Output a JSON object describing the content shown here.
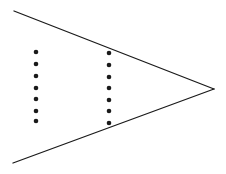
{
  "diagram": {
    "width": 226,
    "height": 174,
    "background": "#ffffff",
    "stroke_color": "#1a1a1a",
    "lines": [
      {
        "name": "upper-converging-line",
        "x1": 14,
        "y1": 11,
        "x2": 214,
        "y2": 89
      },
      {
        "name": "lower-converging-line",
        "x1": 13,
        "y1": 163,
        "x2": 214,
        "y2": 89
      }
    ],
    "apex": {
      "x": 214,
      "y": 89
    },
    "dot_columns": [
      {
        "name": "left-dot-column",
        "x": 36,
        "ys": [
          52,
          64,
          76,
          88,
          99,
          111,
          121
        ]
      },
      {
        "name": "right-dot-column",
        "x": 109,
        "ys": [
          53,
          65,
          77,
          88,
          100,
          111,
          123
        ]
      }
    ],
    "dot_radius": 2.3
  }
}
